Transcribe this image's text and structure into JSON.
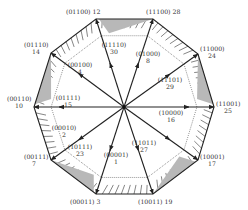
{
  "diagram": {
    "type": "space-vector-decagon",
    "center": [
      124,
      107
    ],
    "colors": {
      "line": "#222222",
      "shade": "#b8b8b8",
      "text": "#333333",
      "background": "#ffffff"
    },
    "vertices": [
      {
        "code": "(11001)",
        "index": "25",
        "pos": [
          214,
          107
        ],
        "label_pos": [
          216,
          106
        ],
        "label_lines": 2,
        "inner_code": "(10000)",
        "inner_index": "16",
        "inner_label_pos": [
          171,
          115
        ],
        "inner_arrow_frac": 0.72
      },
      {
        "code": "(11000)",
        "index": "24",
        "pos": [
          198,
          54
        ],
        "label_pos": [
          200,
          51
        ],
        "label_lines": 2,
        "inner_code": "(11101)",
        "inner_index": "29",
        "inner_label_pos": [
          170,
          82
        ],
        "inner_arrow_frac": 0.62
      },
      {
        "code": "(11100)",
        "index": "28",
        "pos": [
          153,
          19
        ],
        "label_pos": [
          146,
          14
        ],
        "label_lines": 1,
        "inner_code": "(01000)",
        "inner_index": "8",
        "inner_label_pos": [
          148,
          56
        ],
        "inner_arrow_frac": 0.5
      },
      {
        "code": "(01100)",
        "index": "12",
        "pos": [
          96,
          19
        ],
        "label_pos": [
          66,
          14
        ],
        "label_lines": 1,
        "inner_code": "(11110)",
        "inner_index": "30",
        "inner_label_pos": [
          114,
          47
        ],
        "inner_arrow_frac": 0.5
      },
      {
        "code": "(01110)",
        "index": "14",
        "pos": [
          51,
          53
        ],
        "label_pos": [
          24,
          47
        ],
        "label_lines": 2,
        "inner_code": "(00100)",
        "inner_index": "4",
        "inner_label_pos": [
          80,
          67
        ],
        "inner_arrow_frac": 0.62
      },
      {
        "code": "(00110)",
        "index": "10",
        "pos": [
          34,
          107
        ],
        "label_pos": [
          7,
          101
        ],
        "label_lines": 2,
        "inner_code": "(01111)",
        "inner_index": "15",
        "inner_label_pos": [
          68,
          100
        ],
        "inner_arrow_frac": 0.72
      },
      {
        "code": "(00111)",
        "index": "7",
        "pos": [
          51,
          160
        ],
        "label_pos": [
          24,
          159
        ],
        "label_lines": 2,
        "inner_code": "(00010)",
        "inner_index": "2",
        "inner_label_pos": [
          64,
          130
        ],
        "inner_arrow_frac": 0.62
      },
      {
        "code": "(00011)",
        "index": "3",
        "pos": [
          96,
          194
        ],
        "label_pos": [
          70,
          204
        ],
        "label_lines": 1,
        "inner_code": "(10111)",
        "inner_index": "23",
        "inner_label_pos": [
          80,
          149
        ],
        "inner_arrow_frac": 0.5
      },
      {
        "code": "(10011)",
        "index": "19",
        "pos": [
          153,
          194
        ],
        "label_pos": [
          138,
          204
        ],
        "label_lines": 1,
        "inner_code": "(00001)",
        "inner_index": "1",
        "inner_label_pos": [
          116,
          157
        ],
        "inner_arrow_frac": 0.5
      },
      {
        "code": "(10001)",
        "index": "17",
        "pos": [
          198,
          160
        ],
        "label_pos": [
          200,
          159
        ],
        "label_lines": 2,
        "inner_code": "(11011)",
        "inner_index": "27",
        "inner_label_pos": [
          144,
          145
        ],
        "inner_arrow_frac": 0.62
      }
    ],
    "shaded_sectors": [
      {
        "between": [
          0,
          1
        ]
      },
      {
        "between": [
          3,
          2
        ]
      },
      {
        "between": [
          5,
          4
        ]
      },
      {
        "between": [
          7,
          6
        ]
      },
      {
        "between": [
          9,
          8
        ]
      }
    ]
  }
}
